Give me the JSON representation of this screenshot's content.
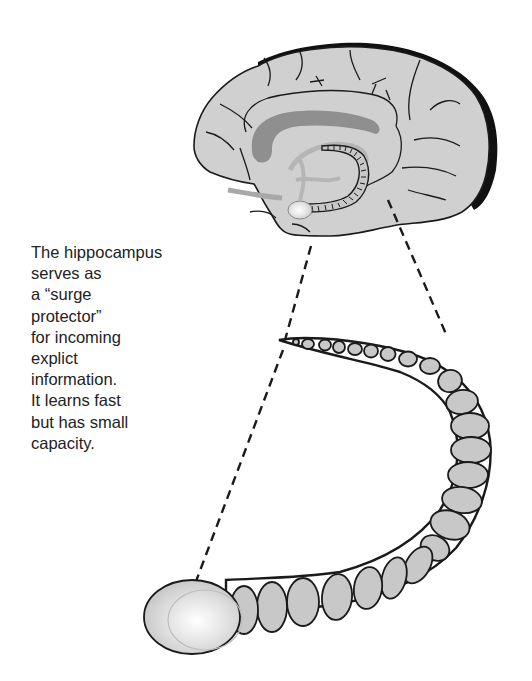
{
  "figure": {
    "subject": "hippocampus",
    "caption_lines": [
      "The hippocampus",
      "serves as",
      "a “surge",
      "protector”",
      "for incoming",
      "explict",
      "information.",
      "It learns fast",
      "but has small",
      "capacity."
    ],
    "colors": {
      "brain_fill": "#d0d0d0",
      "outline": "#1a1a1a",
      "cortex_edge": "#111111",
      "corpus_callosum": "#8f8f8f",
      "inner_structures": "#b5b5b5",
      "hippocampus_segment": "#c8c8c8",
      "amygdala_highlight": "#f2f2f2"
    }
  }
}
